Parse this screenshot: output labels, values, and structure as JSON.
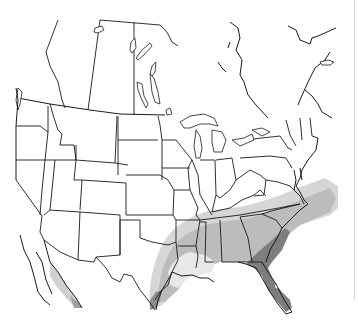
{
  "map": {
    "title": "Species range map — North America",
    "region": "United States, southern Canada, northern Mexico",
    "legend": {
      "zones": [
        {
          "name": "outer-range",
          "color": "#d4d4d4"
        },
        {
          "name": "core-range",
          "color": "#b9b9b9"
        },
        {
          "name": "inner-light",
          "color": "#e6e6e6"
        },
        {
          "name": "primary-range",
          "color": "#7d7d7d"
        }
      ]
    },
    "colors": {
      "background": "#ffffff",
      "borders": "#1a1a1a",
      "light_shade": "#d4d4d4",
      "medium_shade": "#b9b9b9",
      "dark_shade": "#7d7d7d"
    },
    "labels": {
      "description": "Shaded range across southeastern United States, Gulf coast, Texas, and northwest Mexico coast; darkest in Florida"
    }
  }
}
